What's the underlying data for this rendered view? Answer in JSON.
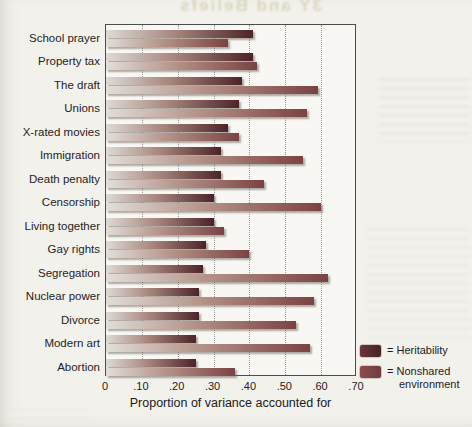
{
  "chart_data": {
    "type": "bar",
    "orientation": "horizontal",
    "title": "",
    "xlabel": "Proportion of variance accounted for",
    "ylabel": "",
    "xlim": [
      0,
      0.7
    ],
    "xticks": [
      "0",
      ".10",
      ".20",
      ".30",
      ".40",
      ".50",
      ".60",
      ".70"
    ],
    "xtick_values": [
      0,
      0.1,
      0.2,
      0.3,
      0.4,
      0.5,
      0.6,
      0.7
    ],
    "grid": "vertical dotted gridlines",
    "legend_position": "bottom-right",
    "categories": [
      "School prayer",
      "Property tax",
      "The draft",
      "Unions",
      "X-rated movies",
      "Immigration",
      "Death penalty",
      "Censorship",
      "Living together",
      "Gay rights",
      "Segregation",
      "Nuclear power",
      "Divorce",
      "Modern art",
      "Abortion"
    ],
    "series": [
      {
        "name": "Heritability",
        "color_dark": "#4c2327",
        "color_light": "#dedad5",
        "values": [
          0.41,
          0.41,
          0.38,
          0.37,
          0.34,
          0.32,
          0.32,
          0.3,
          0.3,
          0.28,
          0.27,
          0.26,
          0.26,
          0.25,
          0.25
        ]
      },
      {
        "name": "Nonshared environment",
        "color_dark": "#7b4243",
        "color_light": "#e2ded9",
        "values": [
          0.34,
          0.42,
          0.59,
          0.56,
          0.37,
          0.55,
          0.44,
          0.6,
          0.33,
          0.4,
          0.62,
          0.58,
          0.53,
          0.57,
          0.36
        ]
      }
    ]
  },
  "legend": {
    "items": [
      {
        "prefix": "=",
        "label": "Heritability"
      },
      {
        "prefix": "=",
        "label": "Nonshared environment"
      }
    ]
  },
  "artifacts": {
    "top_bleed_text": "3Y and Beliefs"
  }
}
